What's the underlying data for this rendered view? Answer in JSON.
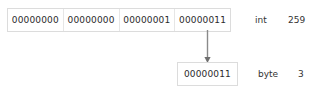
{
  "diagram": {
    "colors": {
      "background": "#ffffff",
      "box_border": "#dcdcdc",
      "cell_divider": "#e6e6e6",
      "text": "#2b2b2b",
      "label_text": "#333333",
      "arrow": "#8a8a8a"
    },
    "int_row": {
      "name": "int",
      "octets": [
        "00000000",
        "00000000",
        "00000001",
        "00000011"
      ],
      "type_label": "int",
      "value_label": "259"
    },
    "byte_row": {
      "name": "byte",
      "octets": [
        "00000011"
      ],
      "type_label": "byte",
      "value_label": "3"
    },
    "arrow": {
      "icon": "down-arrow-icon",
      "direction": "down",
      "from": "int-octet-4",
      "to": "byte-box"
    }
  }
}
